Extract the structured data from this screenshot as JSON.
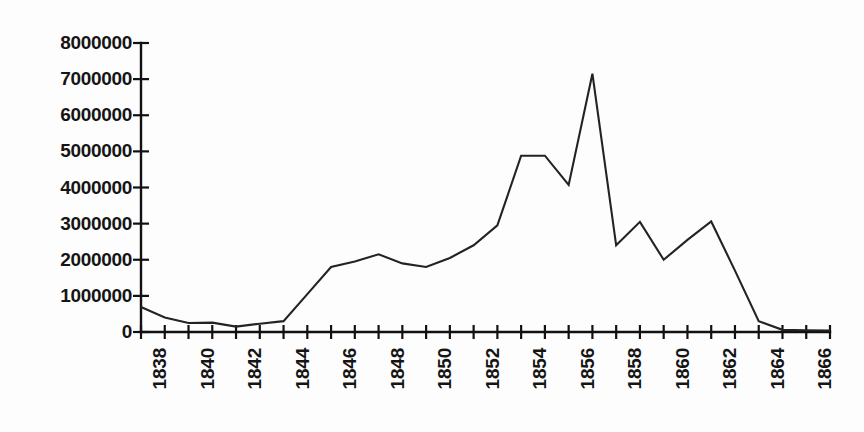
{
  "chart_data": {
    "type": "line",
    "title": "",
    "subtitle": "",
    "xlabel": "",
    "ylabel": "",
    "grid": false,
    "legend": false,
    "legend_position": "none",
    "xlim": [
      1838,
      1867
    ],
    "ylim": [
      0,
      8000000
    ],
    "y_ticks": [
      0,
      1000000,
      2000000,
      3000000,
      4000000,
      5000000,
      6000000,
      7000000,
      8000000
    ],
    "y_tick_labels": [
      "0",
      "1000000",
      "2000000",
      "3000000",
      "4000000",
      "5000000",
      "6000000",
      "7000000",
      "8000000"
    ],
    "x_ticks": [
      1838,
      1839,
      1840,
      1841,
      1842,
      1843,
      1844,
      1845,
      1846,
      1847,
      1848,
      1849,
      1850,
      1851,
      1852,
      1853,
      1854,
      1855,
      1856,
      1857,
      1858,
      1859,
      1860,
      1861,
      1862,
      1863,
      1864,
      1865,
      1866,
      1867
    ],
    "x_tick_labels": [
      "1838",
      "",
      "1840",
      "",
      "1842",
      "",
      "1844",
      "",
      "1846",
      "",
      "1848",
      "",
      "1850",
      "",
      "1852",
      "",
      "1854",
      "",
      "1856",
      "",
      "1858",
      "",
      "1860",
      "",
      "1862",
      "",
      "1864",
      "",
      "1866",
      ""
    ],
    "x": [
      1838,
      1839,
      1840,
      1841,
      1842,
      1843,
      1844,
      1845,
      1846,
      1847,
      1848,
      1849,
      1850,
      1851,
      1852,
      1853,
      1854,
      1855,
      1856,
      1857,
      1858,
      1859,
      1860,
      1861,
      1862,
      1863,
      1864,
      1865,
      1866,
      1867
    ],
    "values": [
      690000,
      400000,
      250000,
      260000,
      150000,
      230000,
      300000,
      1050000,
      1800000,
      1950000,
      2150000,
      1900000,
      1800000,
      2050000,
      2400000,
      2950000,
      4880000,
      4880000,
      4070000,
      7150000,
      2400000,
      3050000,
      2000000,
      2550000,
      3060000,
      1700000,
      300000,
      60000,
      50000,
      40000
    ],
    "series_name": "",
    "line_color": "#232323"
  },
  "axis": {
    "y_axis_name": "y-axis",
    "x_axis_name": "x-axis"
  }
}
